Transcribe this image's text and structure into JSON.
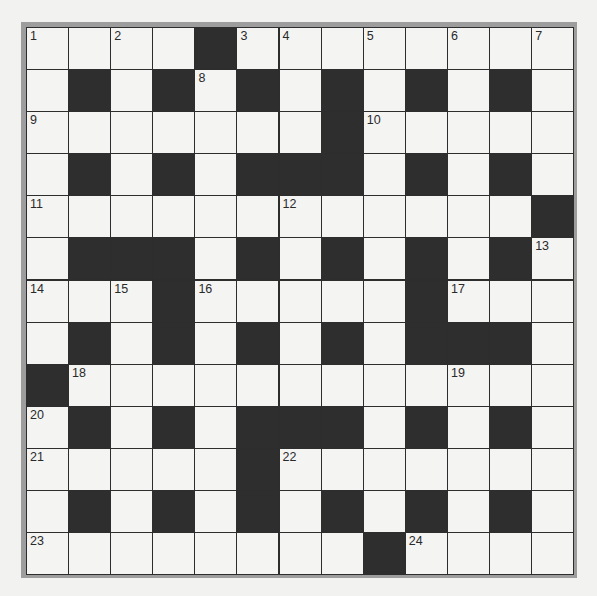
{
  "puzzle": {
    "type": "crossword",
    "rows": 13,
    "cols": 13,
    "colors": {
      "black_square": "#2e2e2e",
      "white_square": "#f4f4f3",
      "grid_lines": "#2d2d2d",
      "frame": "#9d9d9d",
      "background": "#f2f2f1"
    },
    "layout": [
      "1.2.#345.6.7",
      "",
      "",
      "",
      "",
      "",
      "",
      "",
      "",
      "",
      "",
      "",
      ""
    ],
    "grid": [
      [
        "1",
        "",
        "2",
        "",
        "#",
        "3",
        "4",
        "",
        "5",
        "",
        "6",
        "",
        "7"
      ],
      [
        "",
        "#",
        "",
        "#",
        "8",
        "#",
        "",
        "#",
        "",
        "#",
        "",
        "#",
        ""
      ],
      [
        "9",
        "",
        "",
        "",
        "",
        "",
        "",
        "#",
        "10",
        "",
        "",
        "",
        ""
      ],
      [
        "",
        "#",
        "",
        "#",
        "",
        "#",
        "#",
        "#",
        "",
        "#",
        "",
        "#",
        ""
      ],
      [
        "11",
        "",
        "",
        "",
        "",
        "",
        "12",
        "",
        "",
        "",
        "",
        "",
        "#"
      ],
      [
        "",
        "#",
        "#",
        "#",
        "",
        "#",
        "",
        "#",
        "",
        "#",
        "",
        "#",
        "13"
      ],
      [
        "14",
        "",
        "15",
        "#",
        "16",
        "",
        "",
        "",
        "",
        "#",
        "17",
        "",
        ""
      ],
      [
        "",
        "#",
        "",
        "#",
        "",
        "#",
        "",
        "#",
        "",
        "#",
        "#",
        "#",
        ""
      ],
      [
        "#",
        "18",
        "",
        "",
        "",
        "",
        "",
        "",
        "",
        "",
        "19",
        "",
        ""
      ],
      [
        "20",
        "#",
        "",
        "#",
        "",
        "#",
        "#",
        "#",
        "",
        "#",
        "",
        "#",
        ""
      ],
      [
        "21",
        "",
        "",
        "",
        "",
        "#",
        "22",
        "",
        "",
        "",
        "",
        "",
        ""
      ],
      [
        "",
        "#",
        "",
        "#",
        "",
        "#",
        "",
        "#",
        "",
        "#",
        "",
        "#",
        ""
      ],
      [
        "23",
        "",
        "",
        "",
        "",
        "",
        "",
        "",
        "#",
        "24",
        "",
        "",
        ""
      ]
    ],
    "clue_numbers": [
      "1",
      "2",
      "3",
      "4",
      "5",
      "6",
      "7",
      "8",
      "9",
      "10",
      "11",
      "12",
      "13",
      "14",
      "15",
      "16",
      "17",
      "18",
      "19",
      "20",
      "21",
      "22",
      "23",
      "24"
    ]
  }
}
